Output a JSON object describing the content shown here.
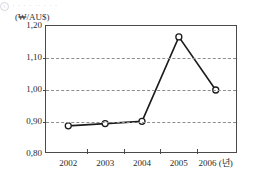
{
  "figure": {
    "top_fragment_text": "· · · ·  ·· · · ·",
    "unit_label": "(₩/AU$)",
    "x_axis_unit": "(년)"
  },
  "chart_data": {
    "type": "line",
    "title": "",
    "subtitle": "",
    "xlabel": "(년)",
    "ylabel": "(₩/AU$)",
    "categories": [
      "2002",
      "2003",
      "2004",
      "2005",
      "2006"
    ],
    "x_tick_labels": [
      "2002",
      "2003",
      "2004",
      "2005",
      "2006 (년)"
    ],
    "y_tick_labels": [
      "1,20",
      "1,10",
      "1,00",
      "0,90",
      "0,80"
    ],
    "y_tick_values": [
      1.2,
      1.1,
      1.0,
      0.9,
      0.8
    ],
    "ylim": [
      0.8,
      1.2
    ],
    "values": [
      0.888,
      0.895,
      0.902,
      1.166,
      1.0
    ],
    "grid": "horizontal-dashed",
    "legend": "none",
    "marker": "open-circle",
    "line_color": "#1b1b1b",
    "grid_color": "#8d8d8d",
    "axis_color": "#4a4a4a"
  }
}
